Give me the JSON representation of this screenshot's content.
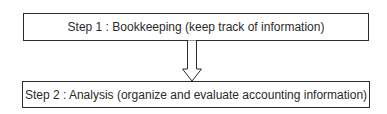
{
  "diagram": {
    "type": "flowchart",
    "steps": [
      {
        "label": "Step 1 : Bookkeeping (keep track of information)"
      },
      {
        "label": "Step 2 : Analysis (organize and evaluate accounting information)"
      }
    ],
    "connectors": [
      {
        "from": 0,
        "to": 1,
        "style": "hollow-block-arrow",
        "direction": "down"
      }
    ],
    "colors": {
      "stroke": "#2b2b2b",
      "fill": "#ffffff",
      "text": "#2a2a2a"
    }
  }
}
